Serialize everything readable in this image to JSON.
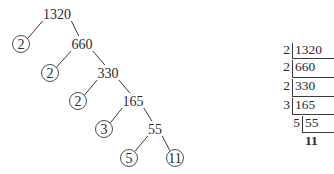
{
  "diagram": {
    "type": "prime-factorization",
    "number": 1320,
    "factor_tree": {
      "nodes": [
        {
          "id": "n1320",
          "label": "1320",
          "x": 57,
          "y": 14,
          "prime": false
        },
        {
          "id": "p2a",
          "label": "2",
          "x": 21,
          "y": 44,
          "prime": true
        },
        {
          "id": "n660",
          "label": "660",
          "x": 82,
          "y": 44,
          "prime": false
        },
        {
          "id": "p2b",
          "label": "2",
          "x": 50,
          "y": 73,
          "prime": true
        },
        {
          "id": "n330",
          "label": "330",
          "x": 108,
          "y": 73,
          "prime": false
        },
        {
          "id": "p2c",
          "label": "2",
          "x": 78,
          "y": 101,
          "prime": true
        },
        {
          "id": "n165",
          "label": "165",
          "x": 133,
          "y": 101,
          "prime": false
        },
        {
          "id": "p3",
          "label": "3",
          "x": 104,
          "y": 129,
          "prime": true
        },
        {
          "id": "n55",
          "label": "55",
          "x": 155,
          "y": 129,
          "prime": false
        },
        {
          "id": "p5",
          "label": "5",
          "x": 129,
          "y": 158,
          "prime": true
        },
        {
          "id": "p11",
          "label": "11",
          "x": 175,
          "y": 158,
          "prime": true
        }
      ],
      "edges": [
        [
          "n1320",
          "p2a"
        ],
        [
          "n1320",
          "n660"
        ],
        [
          "n660",
          "p2b"
        ],
        [
          "n660",
          "n330"
        ],
        [
          "n330",
          "p2c"
        ],
        [
          "n330",
          "n165"
        ],
        [
          "n165",
          "p3"
        ],
        [
          "n165",
          "n55"
        ],
        [
          "n55",
          "p5"
        ],
        [
          "n55",
          "p11"
        ]
      ]
    },
    "division_ladder": {
      "rows": [
        {
          "divisor": "2",
          "quotient": "1320"
        },
        {
          "divisor": "2",
          "quotient": "660"
        },
        {
          "divisor": "2",
          "quotient": "330"
        },
        {
          "divisor": "3",
          "quotient": "165"
        },
        {
          "divisor": "5",
          "quotient": "55"
        },
        {
          "divisor": "",
          "quotient": "11"
        }
      ]
    }
  }
}
